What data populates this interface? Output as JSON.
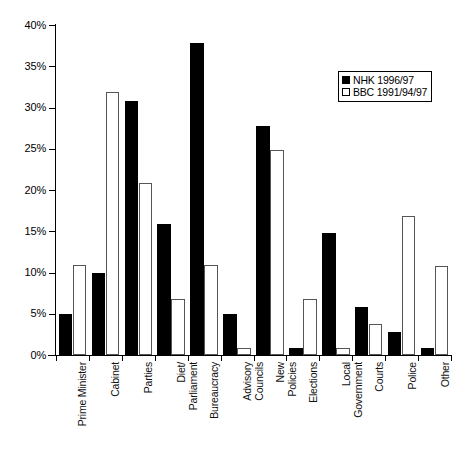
{
  "chart_data": {
    "type": "bar",
    "title": "",
    "subtitle": "",
    "xlabel": "",
    "ylabel": "",
    "ylim": [
      0,
      40
    ],
    "ytick_values": [
      0,
      5,
      10,
      15,
      20,
      25,
      30,
      35,
      40
    ],
    "ytick_labels": [
      "0%",
      "5%",
      "10%",
      "15%",
      "20%",
      "25%",
      "30%",
      "35%",
      "40%"
    ],
    "grid": false,
    "legend_position": "top-right",
    "categories": [
      "Prime Minister",
      "Cabinet",
      "Parties",
      "Diet/\nParliament",
      "Bureaucracy",
      "Advisory\nCouncils",
      "New\nPolicies",
      "Elections",
      "Local\nGovernment",
      "Courts",
      "Police",
      "Other"
    ],
    "series": [
      {
        "name": "NHK 1996/97",
        "color": "#000000",
        "style": "filled",
        "values": [
          5.0,
          9.9,
          30.8,
          15.9,
          37.8,
          5.0,
          27.8,
          0.8,
          14.8,
          5.8,
          2.8,
          0.8
        ]
      },
      {
        "name": "BBC 1991/94/97",
        "color": "#ffffff",
        "style": "hollow",
        "values": [
          10.9,
          31.9,
          20.8,
          6.8,
          10.9,
          0.9,
          24.9,
          6.8,
          0.8,
          3.8,
          16.8,
          10.8
        ]
      }
    ]
  },
  "legend": {
    "items": [
      {
        "label": "NHK 1996/97",
        "swatch": "filled-square-icon"
      },
      {
        "label": "BBC 1991/94/97",
        "swatch": "hollow-square-icon"
      }
    ]
  },
  "colors": {
    "axis": "#000000",
    "nhk_fill": "#000000",
    "bbc_fill": "#ffffff",
    "bbc_stroke": "#555555",
    "background": "#ffffff"
  }
}
